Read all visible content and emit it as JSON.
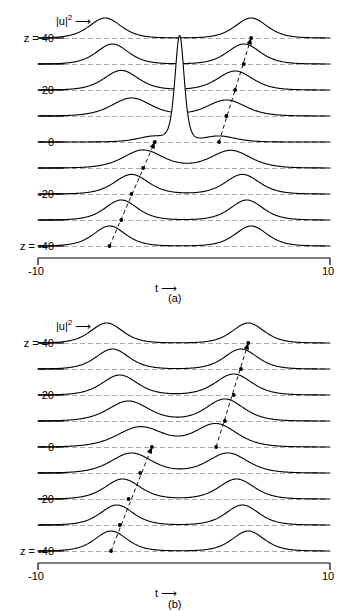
{
  "figure": {
    "axis_label_x": "t",
    "axis_label_x_arrow": "⟶",
    "amplitude_label": "|u|",
    "amplitude_label_exponent": "2",
    "amplitude_label_arrow": "⟶",
    "z_prefix": "z = ",
    "x_min_label": "-10",
    "x_max_label": "10",
    "panel_a_caption": "(a)",
    "panel_b_caption": "(b)",
    "line_color": "#000000",
    "dashed_color": "#555555",
    "background": "#ffffff"
  },
  "panels": [
    {
      "id": "a",
      "caption": "(a)",
      "z_labels": [
        "z = 40",
        "20",
        "0",
        "-20",
        "z = -40"
      ],
      "trace_count": 9
    },
    {
      "id": "b",
      "caption": "(b)",
      "z_labels": [
        "z = 40",
        "20",
        "0",
        "20",
        "z = -40"
      ],
      "trace_count": 9
    }
  ],
  "chart_data": [
    {
      "type": "line",
      "title": "(a)",
      "xlabel": "t",
      "ylabel": "|u|^2",
      "xlim": [
        -10,
        10
      ],
      "grid": false,
      "legend": false,
      "waterfall_axis": "z",
      "z_values": [
        40,
        30,
        20,
        10,
        0,
        -10,
        -20,
        -30,
        -40
      ],
      "z_tick_labels": {
        "40": "z = 40",
        "20": "20",
        "0": "0",
        "-20": "-20",
        "-40": "z = -40"
      },
      "annotations": [
        {
          "kind": "dashed-baseline",
          "per_trace": true
        },
        {
          "kind": "dashed-arrow",
          "from": [
            -5.1,
            -40
          ],
          "to": [
            -2.0,
            0
          ],
          "label": "left pulse peak track"
        },
        {
          "kind": "dashed-arrow",
          "from": [
            2.4,
            0
          ],
          "to": [
            4.6,
            40
          ],
          "label": "right pulse peak track"
        },
        {
          "kind": "marker-dot",
          "points": [
            [
              -5.1,
              -40
            ],
            [
              -4.3,
              -30
            ],
            [
              -3.6,
              -20
            ],
            [
              -2.8,
              -10
            ],
            [
              -2.0,
              0
            ],
            [
              2.4,
              0
            ],
            [
              2.9,
              10
            ],
            [
              3.5,
              20
            ],
            [
              4.1,
              30
            ],
            [
              4.6,
              40
            ]
          ]
        },
        {
          "kind": "central-spike",
          "at_z": 0,
          "t": -0.3,
          "height_rel": 5.2,
          "note": "tall narrow spike rising from z=0 trace"
        }
      ],
      "series": [
        {
          "name": "z = 40",
          "z": 40,
          "peaks": [
            {
              "t": -5.4,
              "amp": 1.0,
              "width": 1.45
            },
            {
              "t": 4.6,
              "amp": 1.0,
              "width": 1.45
            }
          ]
        },
        {
          "name": "z = 30",
          "z": 30,
          "peaks": [
            {
              "t": -4.9,
              "amp": 1.0,
              "width": 1.45
            },
            {
              "t": 4.1,
              "amp": 1.0,
              "width": 1.5
            }
          ]
        },
        {
          "name": "z = 20",
          "z": 20,
          "peaks": [
            {
              "t": -4.3,
              "amp": 0.98,
              "width": 1.55
            },
            {
              "t": 3.5,
              "amp": 0.95,
              "width": 1.6
            }
          ]
        },
        {
          "name": "z = 10",
          "z": 10,
          "peaks": [
            {
              "t": -3.6,
              "amp": 0.9,
              "width": 1.8
            },
            {
              "t": 2.9,
              "amp": 0.8,
              "width": 1.75
            }
          ]
        },
        {
          "name": "z = 0",
          "z": 0,
          "peaks": [
            {
              "t": -2.0,
              "amp": 0.3,
              "width": 1.5
            },
            {
              "t": 2.4,
              "amp": 0.3,
              "width": 1.5
            }
          ],
          "spike": {
            "t": -0.3,
            "amp": 5.2,
            "width": 0.42
          }
        },
        {
          "name": "z = -10",
          "z": -10,
          "peaks": [
            {
              "t": -2.8,
              "amp": 0.9,
              "width": 1.8
            },
            {
              "t": 3.2,
              "amp": 0.88,
              "width": 1.8
            }
          ]
        },
        {
          "name": "z = -20",
          "z": -20,
          "peaks": [
            {
              "t": -3.6,
              "amp": 0.98,
              "width": 1.55
            },
            {
              "t": 4.0,
              "amp": 0.98,
              "width": 1.55
            }
          ]
        },
        {
          "name": "z = -30",
          "z": -30,
          "peaks": [
            {
              "t": -4.3,
              "amp": 1.0,
              "width": 1.48
            },
            {
              "t": 4.3,
              "amp": 1.0,
              "width": 1.48
            }
          ]
        },
        {
          "name": "z = -40",
          "z": -40,
          "peaks": [
            {
              "t": -5.1,
              "amp": 1.0,
              "width": 1.45
            },
            {
              "t": 4.6,
              "amp": 1.0,
              "width": 1.45
            }
          ]
        }
      ]
    },
    {
      "type": "line",
      "title": "(b)",
      "xlabel": "t",
      "ylabel": "|u|^2",
      "xlim": [
        -10,
        10
      ],
      "grid": false,
      "legend": false,
      "waterfall_axis": "z",
      "z_values": [
        40,
        30,
        20,
        10,
        0,
        -10,
        -20,
        -30,
        -40
      ],
      "z_tick_labels": {
        "40": "z = 40",
        "20": "20",
        "0": "0",
        "-20": "20",
        "-40": "z = -40"
      },
      "annotations": [
        {
          "kind": "dashed-baseline",
          "per_trace": true
        },
        {
          "kind": "dashed-arrow",
          "from": [
            -5.0,
            -40
          ],
          "to": [
            -2.2,
            0
          ],
          "label": "left pulse peak track"
        },
        {
          "kind": "dashed-arrow",
          "from": [
            2.2,
            0
          ],
          "to": [
            4.4,
            40
          ],
          "label": "right pulse peak track"
        },
        {
          "kind": "marker-dot",
          "points": [
            [
              -5.0,
              -40
            ],
            [
              -4.4,
              -30
            ],
            [
              -3.8,
              -20
            ],
            [
              -3.0,
              -10
            ],
            [
              -2.2,
              0
            ],
            [
              2.2,
              0
            ],
            [
              2.8,
              10
            ],
            [
              3.4,
              20
            ],
            [
              3.9,
              30
            ],
            [
              4.4,
              40
            ]
          ]
        }
      ],
      "series": [
        {
          "name": "z = 40",
          "z": 40,
          "peaks": [
            {
              "t": -5.3,
              "amp": 1.0,
              "width": 1.45
            },
            {
              "t": 4.4,
              "amp": 1.0,
              "width": 1.45
            }
          ]
        },
        {
          "name": "z = 30",
          "z": 30,
          "peaks": [
            {
              "t": -4.9,
              "amp": 1.0,
              "width": 1.5
            },
            {
              "t": 3.9,
              "amp": 1.0,
              "width": 1.5
            }
          ]
        },
        {
          "name": "z = 20",
          "z": 20,
          "peaks": [
            {
              "t": -4.4,
              "amp": 1.0,
              "width": 1.6
            },
            {
              "t": 3.4,
              "amp": 1.05,
              "width": 1.65
            }
          ]
        },
        {
          "name": "z = 10",
          "z": 10,
          "peaks": [
            {
              "t": -3.8,
              "amp": 1.0,
              "width": 1.85
            },
            {
              "t": 2.8,
              "amp": 1.1,
              "width": 1.7
            }
          ]
        },
        {
          "name": "z = 0",
          "z": 0,
          "peaks": [
            {
              "t": -3.0,
              "amp": 1.0,
              "width": 2.1
            },
            {
              "t": 2.2,
              "amp": 1.15,
              "width": 1.9
            }
          ]
        },
        {
          "name": "z = -10",
          "z": -10,
          "peaks": [
            {
              "t": -3.6,
              "amp": 1.0,
              "width": 1.85
            },
            {
              "t": 3.0,
              "amp": 1.0,
              "width": 1.8
            }
          ]
        },
        {
          "name": "z = -20",
          "z": -20,
          "peaks": [
            {
              "t": -4.2,
              "amp": 1.0,
              "width": 1.6
            },
            {
              "t": 3.6,
              "amp": 1.0,
              "width": 1.6
            }
          ]
        },
        {
          "name": "z = -30",
          "z": -30,
          "peaks": [
            {
              "t": -4.6,
              "amp": 1.0,
              "width": 1.5
            },
            {
              "t": 4.0,
              "amp": 1.0,
              "width": 1.5
            }
          ]
        },
        {
          "name": "z = -40",
          "z": -40,
          "peaks": [
            {
              "t": -5.0,
              "amp": 1.0,
              "width": 1.45
            },
            {
              "t": 4.4,
              "amp": 1.0,
              "width": 1.45
            }
          ]
        }
      ]
    }
  ]
}
